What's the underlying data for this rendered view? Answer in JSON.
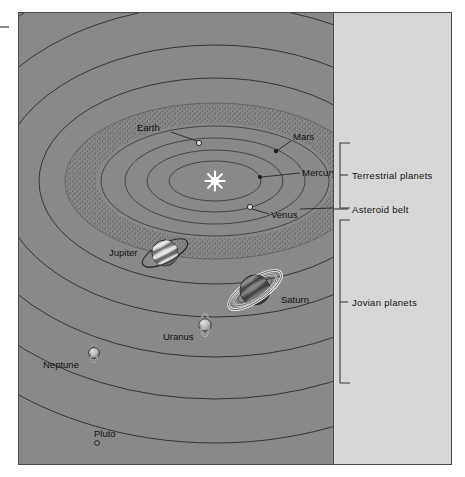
{
  "figure": {
    "panels": {
      "diagram_bg": "#898989",
      "legend_bg": "#d7d7d7"
    }
  },
  "diagram": {
    "sun": {
      "name": "Sun",
      "icon": "sun-starburst-icon"
    },
    "planets": [
      {
        "name": "Mercury",
        "label": "Mercury",
        "group": "terrestrial"
      },
      {
        "name": "Venus",
        "label": "Venus",
        "group": "terrestrial"
      },
      {
        "name": "Earth",
        "label": "Earth",
        "group": "terrestrial"
      },
      {
        "name": "Mars",
        "label": "Mars",
        "group": "terrestrial"
      },
      {
        "name": "Jupiter",
        "label": "Jupiter",
        "group": "jovian"
      },
      {
        "name": "Saturn",
        "label": "Saturn",
        "group": "jovian"
      },
      {
        "name": "Uranus",
        "label": "Uranus",
        "group": "jovian"
      },
      {
        "name": "Neptune",
        "label": "Neptune",
        "group": "jovian"
      },
      {
        "name": "Pluto",
        "label": "Pluto",
        "group": "outer"
      }
    ],
    "features": [
      {
        "name": "asteroid-belt",
        "label": "Asteroid belt"
      }
    ]
  },
  "legend": {
    "brackets": [
      {
        "id": "terrestrial",
        "label": "Terrestrial planets"
      },
      {
        "id": "jovian",
        "label": "Jovian planets"
      }
    ],
    "callouts": [
      {
        "id": "asteroid-belt",
        "label": "Asteroid belt"
      }
    ]
  },
  "labels": {
    "earth": "Earth",
    "mars": "Mars",
    "mercury": "Mercury",
    "venus": "Venus",
    "jupiter": "Jupiter",
    "saturn": "Saturn",
    "uranus": "Uranus",
    "neptune": "Neptune",
    "pluto": "Pluto",
    "terrestrial_planets": "Terrestrial planets",
    "asteroid_belt": "Asteroid belt",
    "jovian_planets": "Jovian planets"
  }
}
